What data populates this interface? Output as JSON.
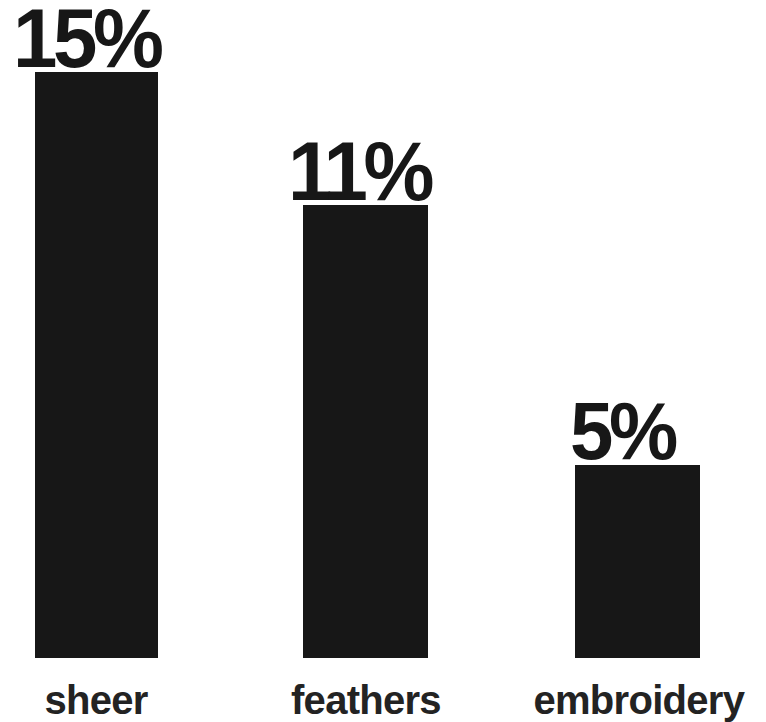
{
  "chart_data": {
    "type": "bar",
    "title": "",
    "subtitle": "",
    "xlabel": "",
    "ylabel": "",
    "categories": [
      "sheer",
      "feathers",
      "embroidery"
    ],
    "values": [
      15,
      11,
      5
    ],
    "value_labels": [
      "15%",
      "11%",
      "5%"
    ],
    "units": "%",
    "ylim": [
      0,
      15
    ],
    "grid": false,
    "legend": null,
    "legend_position": "none",
    "annotations": [],
    "series": [
      {
        "name": "",
        "values": [
          15,
          11,
          5
        ]
      }
    ],
    "style": {
      "bar_color": "#171717",
      "label_color": "#171717",
      "category_color": "#232323",
      "background": "#ffffff",
      "orientation": "vertical",
      "value_label_position": "above-bar"
    }
  },
  "bars": [
    {
      "category": "sheer",
      "value": 15,
      "value_label": "15%",
      "bar_left_px": 35,
      "bar_width_px": 123,
      "bar_top_px": 72,
      "bar_height_px": 586,
      "label_left_px": 13,
      "label_bottom_px": 648,
      "label_font_px": 84,
      "category_center_px": 96,
      "category_font_px": 40
    },
    {
      "category": "feathers",
      "value": 11,
      "value_label": "11%",
      "bar_left_px": 303,
      "bar_width_px": 125,
      "bar_top_px": 205,
      "bar_height_px": 453,
      "label_left_px": 288,
      "label_bottom_px": 515,
      "label_font_px": 84,
      "category_center_px": 366,
      "category_font_px": 40
    },
    {
      "category": "embroidery",
      "value": 5,
      "value_label": "5%",
      "bar_left_px": 575,
      "bar_width_px": 125,
      "bar_top_px": 465,
      "bar_height_px": 193,
      "label_left_px": 570,
      "label_bottom_px": 255,
      "label_font_px": 82,
      "category_center_px": 639,
      "category_font_px": 40
    }
  ],
  "layout": {
    "canvas_width": 766,
    "canvas_height": 722,
    "baseline_y": 658,
    "category_baseline_y": 680
  }
}
